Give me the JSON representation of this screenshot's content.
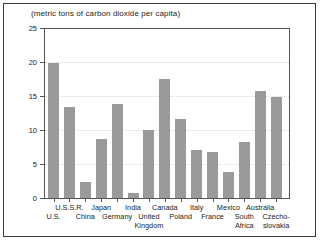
{
  "chart_data": {
    "type": "bar",
    "title": "(metric tons of carbon dioxide per capita)",
    "xlabel": "",
    "ylabel": "",
    "ylim": [
      0,
      25
    ],
    "yticks": [
      0,
      5,
      10,
      15,
      20,
      25
    ],
    "ytick_labels": [
      "0",
      "5",
      "10",
      "15",
      "20",
      "25"
    ],
    "grid": true,
    "grid_axis": "y",
    "legend": false,
    "bar_color": "#9a9a9a",
    "categories": [
      "U.S.",
      "U.S.S.R.",
      "China",
      "Japan",
      "Germany",
      "India",
      "United Kingdom",
      "Canada",
      "Poland",
      "Italy",
      "France",
      "Mexico",
      "South Africa",
      "Australia",
      "Czechoslovakia"
    ],
    "category_label_lines": [
      [
        "",
        "U.S.",
        ""
      ],
      [
        "U.S.S.R.",
        "",
        ""
      ],
      [
        "",
        "China",
        ""
      ],
      [
        "Japan",
        "",
        ""
      ],
      [
        "",
        "Germany",
        ""
      ],
      [
        "India",
        "",
        ""
      ],
      [
        "",
        "United",
        "Kingdom"
      ],
      [
        "Canada",
        "",
        ""
      ],
      [
        "",
        "Poland",
        ""
      ],
      [
        "Italy",
        "",
        ""
      ],
      [
        "",
        "France",
        ""
      ],
      [
        "Mexico",
        "",
        ""
      ],
      [
        "",
        "South",
        "Africa"
      ],
      [
        "Australia",
        "",
        ""
      ],
      [
        "",
        "Czecho-",
        "slovakia"
      ]
    ],
    "values": [
      19.9,
      13.4,
      2.4,
      8.7,
      13.8,
      0.8,
      10.0,
      17.5,
      11.6,
      7.0,
      6.7,
      3.8,
      8.2,
      15.7,
      14.8
    ]
  }
}
